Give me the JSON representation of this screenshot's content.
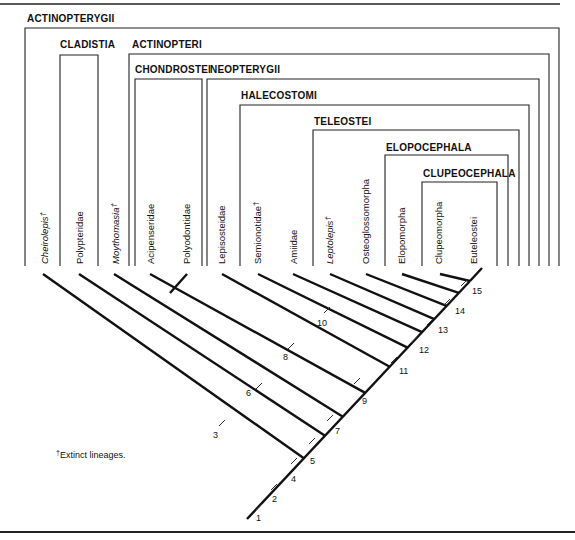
{
  "figure": {
    "type": "cladogram",
    "groups": [
      {
        "id": "actinopterygii",
        "label": "ACTINOPTERYGII"
      },
      {
        "id": "cladistia",
        "label": "CLADISTIA"
      },
      {
        "id": "actinopteri",
        "label": "ACTINOPTERI"
      },
      {
        "id": "chondrostei",
        "label": "CHONDROSTEI"
      },
      {
        "id": "neopterygii",
        "label": "NEOPTERYGII"
      },
      {
        "id": "halecostomi",
        "label": "HALECOSTOMI"
      },
      {
        "id": "teleostei",
        "label": "TELEOSTEI"
      },
      {
        "id": "elopocephala",
        "label": "ELOPOCEPHALA"
      },
      {
        "id": "clupeocephala",
        "label": "CLUPEOCEPHALA"
      }
    ],
    "taxa": [
      {
        "name": "Cheirolepis",
        "extinct": true,
        "italic": true
      },
      {
        "name": "Polypteridae",
        "extinct": false,
        "italic": false
      },
      {
        "name": "Moythomasia",
        "extinct": true,
        "italic": true
      },
      {
        "name": "Acipenseridae",
        "extinct": false,
        "italic": false
      },
      {
        "name": "Polyodontidae",
        "extinct": false,
        "italic": false
      },
      {
        "name": "Lepisosteidae",
        "extinct": false,
        "italic": false
      },
      {
        "name": "Semionotidae",
        "extinct": true,
        "italic": false
      },
      {
        "name": "Amiidae",
        "extinct": false,
        "italic": false
      },
      {
        "name": "Leptolepis",
        "extinct": true,
        "italic": true
      },
      {
        "name": "Osteoglossomorpha",
        "extinct": false,
        "italic": false
      },
      {
        "name": "Elopomorpha",
        "extinct": false,
        "italic": false
      },
      {
        "name": "Clupeomorpha",
        "extinct": false,
        "italic": false
      },
      {
        "name": "Euteleostei",
        "extinct": false,
        "italic": false
      }
    ],
    "dagger": "†",
    "nodes": [
      "1",
      "2",
      "3",
      "4",
      "5",
      "6",
      "7",
      "8",
      "9",
      "10",
      "11",
      "12",
      "13",
      "14",
      "15"
    ],
    "footnote": "Extinct lineages."
  }
}
